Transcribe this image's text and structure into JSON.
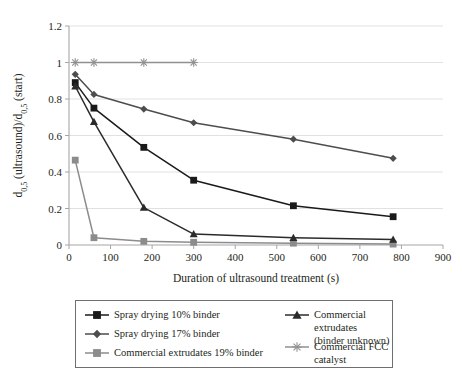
{
  "figure": {
    "name": "ultrasound-attrition-chart"
  },
  "chart_data": {
    "type": "line",
    "title": "",
    "subtitle": "",
    "xlabel": "Duration of ultrasound treatment (s)",
    "ylabel": "d0,5 (ultrasound)/d0,5 (start)",
    "ylabel_parts": {
      "d_main": "d",
      "sub": "0,5",
      "mid": " (ultrasound)/d",
      "sub2": "0,5",
      "tail": " (start)"
    },
    "xlim": [
      0,
      900
    ],
    "ylim": [
      0,
      1.2
    ],
    "xticks": [
      0,
      100,
      200,
      300,
      400,
      500,
      600,
      700,
      800,
      900
    ],
    "xticklabels": [
      "0",
      "100",
      "200",
      "300",
      "400",
      "500",
      "600",
      "700",
      "800",
      "900"
    ],
    "yticks": [
      0,
      0.2,
      0.4,
      0.6,
      0.8,
      1,
      1.2
    ],
    "yticklabels": [
      "0",
      "0.2",
      "0.4",
      "0.6",
      "0.8",
      "1",
      "1.2"
    ],
    "grid": "horizontal",
    "legend_position": "below-plot",
    "series": [
      {
        "name": "Spray drying 10% binder",
        "marker": "square",
        "color": "#1a1a1a",
        "x": [
          15,
          60,
          180,
          300,
          540,
          780
        ],
        "values": [
          0.89,
          0.75,
          0.535,
          0.355,
          0.215,
          0.155
        ]
      },
      {
        "name": "Spray drying 17% binder",
        "marker": "diamond",
        "color": "#4d4d4d",
        "x": [
          15,
          60,
          180,
          300,
          540,
          780
        ],
        "values": [
          0.935,
          0.825,
          0.745,
          0.67,
          0.58,
          0.475
        ]
      },
      {
        "name": "Commercial extrudates 19% binder",
        "marker": "square",
        "color": "#8c8c8c",
        "x": [
          15,
          60,
          180,
          300,
          540,
          780
        ],
        "values": [
          0.465,
          0.04,
          0.02,
          0.015,
          0.01,
          0.005
        ]
      },
      {
        "name": "Commercial extrudates (binder unknown)",
        "marker": "triangle",
        "color": "#2b2b2b",
        "x": [
          15,
          60,
          180,
          300,
          540,
          780
        ],
        "values": [
          0.87,
          0.675,
          0.205,
          0.06,
          0.04,
          0.03
        ]
      },
      {
        "name": "Commercial FCC catalyst",
        "marker": "asterisk",
        "color": "#909090",
        "x": [
          15,
          60,
          180,
          300
        ],
        "values": [
          1.0,
          1.0,
          1.0,
          1.0
        ]
      }
    ]
  },
  "legend": {
    "left_column": [
      {
        "label": "Spray drying 10% binder",
        "marker": "square",
        "color": "#1a1a1a"
      },
      {
        "label": "Spray drying 17% binder",
        "marker": "diamond",
        "color": "#4d4d4d"
      },
      {
        "label": "Commercial extrudates 19% binder",
        "marker": "square",
        "color": "#8c8c8c"
      }
    ],
    "right_column": [
      {
        "label": "Commercial extrudates\n(binder unknown)",
        "marker": "triangle",
        "color": "#2b2b2b"
      },
      {
        "label": "Commercial FCC catalyst",
        "marker": "asterisk",
        "color": "#909090"
      }
    ]
  },
  "colors": {
    "axis": "#a6a6a6",
    "grid": "#d9d9d9",
    "text": "#231f20",
    "legend_border": "#6f6f6f"
  }
}
